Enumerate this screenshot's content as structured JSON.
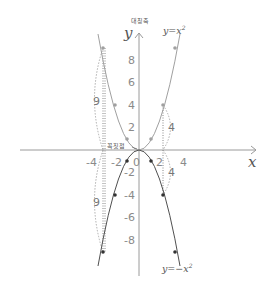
{
  "figure": {
    "axes": {
      "x_label": "x",
      "y_label": "y",
      "symmetry_axis_label": "대칭축",
      "vertex_label": "꼭짓점",
      "x_ticks": [
        "-4",
        "-2",
        "0",
        "2",
        "4"
      ],
      "y_ticks_positive": [
        "8",
        "6",
        "4",
        "2"
      ],
      "y_ticks_negative": [
        "-2",
        "-4",
        "-6",
        "-8"
      ]
    },
    "curves": [
      {
        "name": "upper-parabola",
        "equation_label": "y=x",
        "exponent": "2",
        "color": "#a0a0a0",
        "points": [
          [
            -3,
            9
          ],
          [
            -2,
            4
          ],
          [
            -1,
            1
          ],
          [
            1,
            1
          ],
          [
            2,
            4
          ],
          [
            3,
            9
          ]
        ]
      },
      {
        "name": "lower-parabola",
        "equation_label": "y=−x",
        "exponent": "2",
        "color": "#505050",
        "points": [
          [
            -3,
            -9
          ],
          [
            -2,
            -4
          ],
          [
            -1,
            -1
          ],
          [
            1,
            -1
          ],
          [
            2,
            -4
          ],
          [
            3,
            -9
          ]
        ]
      }
    ],
    "distance_annotations": {
      "left_upper": "9",
      "left_lower": "9",
      "right_upper": "4",
      "right_lower": "4"
    },
    "colors": {
      "axis": "#9a9a9a",
      "upper_curve": "#a0a0a0",
      "lower_curve": "#505050",
      "dotted": "#888888"
    }
  }
}
